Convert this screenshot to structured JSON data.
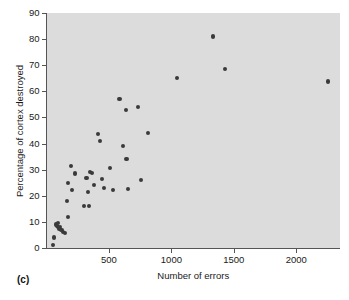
{
  "panel": {
    "label": "(c)"
  },
  "chart_data": {
    "type": "scatter",
    "title": "",
    "xlabel": "Number of errors",
    "ylabel": "Percentage of cortex destroyed",
    "xlim": [
      0,
      2350
    ],
    "ylim": [
      0,
      90
    ],
    "xticks": [
      500,
      1000,
      1500,
      2000
    ],
    "xtick_labels": [
      "500",
      "1000",
      "1500",
      "2000"
    ],
    "yticks": [
      0,
      10,
      20,
      30,
      40,
      50,
      60,
      70,
      80,
      90
    ],
    "ytick_labels": [
      "0",
      "10",
      "20",
      "30",
      "40",
      "50",
      "60",
      "70",
      "80",
      "90"
    ],
    "grid": false,
    "legend": null,
    "marker_color": "#3a3a3a",
    "plot_bg_color": "#dcdcdc",
    "points": [
      {
        "x": 55,
        "y": 1
      },
      {
        "x": 60,
        "y": 4
      },
      {
        "x": 75,
        "y": 9
      },
      {
        "x": 85,
        "y": 8.5
      },
      {
        "x": 90,
        "y": 8
      },
      {
        "x": 95,
        "y": 9.5
      },
      {
        "x": 100,
        "y": 7.5
      },
      {
        "x": 110,
        "y": 8
      },
      {
        "x": 120,
        "y": 7
      },
      {
        "x": 130,
        "y": 6
      },
      {
        "x": 150,
        "y": 5.8
      },
      {
        "x": 170,
        "y": 11.8
      },
      {
        "x": 165,
        "y": 18
      },
      {
        "x": 175,
        "y": 25
      },
      {
        "x": 195,
        "y": 31.4
      },
      {
        "x": 205,
        "y": 22.3
      },
      {
        "x": 225,
        "y": 28.5
      },
      {
        "x": 300,
        "y": 16
      },
      {
        "x": 320,
        "y": 26.8
      },
      {
        "x": 330,
        "y": 21.3
      },
      {
        "x": 340,
        "y": 16.2
      },
      {
        "x": 350,
        "y": 29
      },
      {
        "x": 365,
        "y": 28.6
      },
      {
        "x": 380,
        "y": 24
      },
      {
        "x": 410,
        "y": 43.7
      },
      {
        "x": 430,
        "y": 41
      },
      {
        "x": 445,
        "y": 26.3
      },
      {
        "x": 460,
        "y": 23
      },
      {
        "x": 510,
        "y": 30.7
      },
      {
        "x": 535,
        "y": 22.2
      },
      {
        "x": 585,
        "y": 57
      },
      {
        "x": 610,
        "y": 39
      },
      {
        "x": 635,
        "y": 53
      },
      {
        "x": 640,
        "y": 34.2
      },
      {
        "x": 655,
        "y": 22.5
      },
      {
        "x": 730,
        "y": 54
      },
      {
        "x": 755,
        "y": 26
      },
      {
        "x": 815,
        "y": 44
      },
      {
        "x": 1045,
        "y": 65
      },
      {
        "x": 1330,
        "y": 81
      },
      {
        "x": 1430,
        "y": 68.7
      },
      {
        "x": 2255,
        "y": 63.8
      }
    ]
  }
}
